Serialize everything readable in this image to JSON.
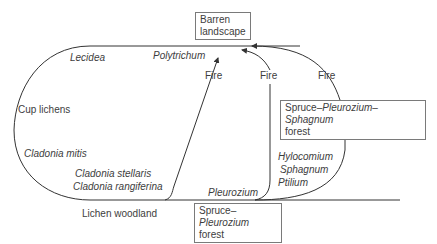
{
  "diagram": {
    "type": "succession-cycle",
    "nodes": {
      "barren": {
        "line1": "Barren",
        "line2": "landscape"
      },
      "spruce_pleurozium_sphagnum": {
        "pre": "Spruce–",
        "it1": "Pleurozium",
        "mid": "–",
        "it2": "Sphagnum",
        "line2": "forest"
      },
      "spruce_pleurozium": {
        "pre": "Spruce–",
        "it1": "Pleurozium",
        "line2": "forest"
      },
      "lichen_woodland": "Lichen woodland"
    },
    "species": {
      "lecidea": "Lecidea",
      "polytrichum": "Polytrichum",
      "cup_lichens": "Cup lichens",
      "cladonia_mitis": "Cladonia mitis",
      "cladonia_stellaris": "Cladonia stellaris",
      "cladonia_rangiferina": "Cladonia rangiferina",
      "pleurozium": "Pleurozium",
      "hylocomium": "Hylocomium",
      "sphagnum": "Sphagnum",
      "ptilium": "Ptilium"
    },
    "edges": [
      {
        "from": "lichen_woodland",
        "to": "barren",
        "label": "Fire"
      },
      {
        "from": "spruce_pleurozium",
        "to": "barren",
        "label": "Fire"
      },
      {
        "from": "spruce_pleurozium_sphagnum",
        "to": "barren",
        "label": "Fire"
      }
    ],
    "colors": {
      "line": "#333333",
      "box_border": "#7a7a7a",
      "text": "#3d3d3d"
    }
  }
}
